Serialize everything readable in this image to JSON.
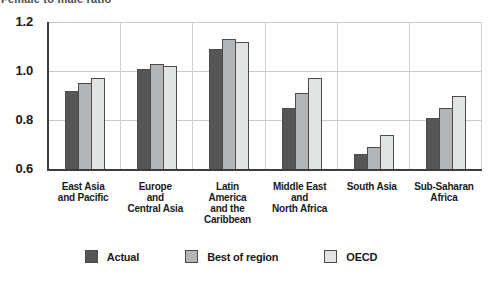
{
  "figure": {
    "caption_clipped": "Female to male ratio"
  },
  "chart_data": {
    "type": "bar",
    "title": "Female to male ratio",
    "xlabel": "",
    "ylabel": "",
    "ylim": [
      0.6,
      1.2
    ],
    "yticks": [
      0.6,
      0.8,
      1.0,
      1.2
    ],
    "ytick_labels": [
      "0.6",
      "0.8",
      "1.0",
      "1.2"
    ],
    "grid": true,
    "legend_position": "bottom",
    "categories": [
      "East Asia\nand Pacific",
      "Europe\nand\nCentral Asia",
      "Latin\nAmerica\nand the\nCaribbean",
      "Middle East\nand\nNorth Africa",
      "South Asia",
      "Sub-Saharan\nAfrica"
    ],
    "series": [
      {
        "name": "Actual",
        "color": "#555658",
        "values": [
          0.92,
          1.01,
          1.09,
          0.85,
          0.66,
          0.81
        ]
      },
      {
        "name": "Best of region",
        "color": "#b3b5b7",
        "values": [
          0.95,
          1.03,
          1.13,
          0.91,
          0.69,
          0.85
        ]
      },
      {
        "name": "OECD",
        "color": "#e2e3e3",
        "values": [
          0.97,
          1.02,
          1.12,
          0.97,
          0.74,
          0.9
        ]
      }
    ]
  }
}
